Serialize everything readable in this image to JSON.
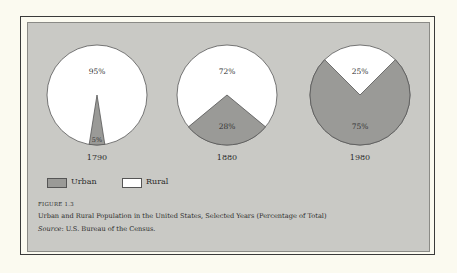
{
  "chart_data": {
    "type": "pie",
    "title": "Urban and Rural Population in the United States, Selected Years (Percentage of Total)",
    "figure_label": "FIGURE 1.3",
    "source": "U.S. Bureau of the Census.",
    "legend": [
      {
        "name": "Urban",
        "color": "#9a9a97"
      },
      {
        "name": "Rural",
        "color": "#ffffff"
      }
    ],
    "charts": [
      {
        "year": "1790",
        "urban": 5,
        "rural": 95,
        "urban_label": "5%",
        "rural_label": "95%"
      },
      {
        "year": "1880",
        "urban": 28,
        "rural": 72,
        "urban_label": "28%",
        "rural_label": "72%"
      },
      {
        "year": "1980",
        "urban": 75,
        "rural": 25,
        "urban_label": "75%",
        "rural_label": "25%"
      }
    ]
  },
  "legend": {
    "urban": "Urban",
    "rural": "Rural"
  },
  "caption": {
    "figure_label": "FIGURE 1.3",
    "title": "Urban and Rural Population in the United States, Selected Years (Percentage of Total)",
    "source_prefix": "Source",
    "source_text": ": U.S. Bureau of the Census."
  },
  "years": [
    "1790",
    "1880",
    "1980"
  ]
}
